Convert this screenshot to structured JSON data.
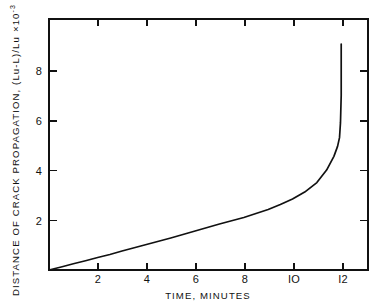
{
  "figure": {
    "background_color": "#ffffff",
    "ink_color": "#111111"
  },
  "chart_data": {
    "type": "line",
    "title": "",
    "subtitle": "",
    "xlabel": "TIME, MINUTES",
    "ylabel": "DISTANCE OF CRACK PROPAGATION, (Lu-L)/Lu",
    "ylabel_scale_prefix": "×10",
    "ylabel_scale_exponent": "-3",
    "ylabel_full": "DISTANCE OF CRACK PROPAGATION, (Lu-L)/Lu ×10⁻³",
    "xlim": [
      0,
      13.1
    ],
    "ylim": [
      0,
      10.05
    ],
    "xticks": [
      2,
      4,
      6,
      8,
      10,
      12
    ],
    "xtick_labels": [
      "2",
      "4",
      "6",
      "8",
      "IO",
      "I2"
    ],
    "yticks": [
      2,
      4,
      6,
      8
    ],
    "ytick_labels": [
      "2",
      "4",
      "6",
      "8"
    ],
    "grid": false,
    "legend": null,
    "legend_position": "none",
    "ticks_direction": "inward",
    "ticks_all_sides": true,
    "series": [
      {
        "name": "crack propagation",
        "x": [
          0.0,
          0.5,
          1.0,
          1.5,
          2.0,
          2.5,
          3.0,
          3.5,
          4.0,
          4.5,
          5.0,
          5.5,
          6.0,
          6.5,
          7.0,
          7.5,
          8.0,
          8.5,
          9.0,
          9.5,
          10.0,
          10.5,
          11.0,
          11.4,
          11.7,
          11.85,
          11.93,
          11.97,
          12.0,
          12.0
        ],
        "y": [
          0.0,
          0.12,
          0.25,
          0.37,
          0.5,
          0.62,
          0.76,
          0.89,
          1.02,
          1.15,
          1.28,
          1.42,
          1.56,
          1.7,
          1.84,
          1.97,
          2.1,
          2.26,
          2.42,
          2.62,
          2.84,
          3.12,
          3.5,
          4.0,
          4.55,
          4.95,
          5.3,
          5.9,
          7.0,
          9.05
        ]
      }
    ]
  }
}
